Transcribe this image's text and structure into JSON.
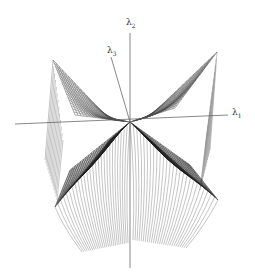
{
  "figure": {
    "type": "3d-wireframe-surface",
    "colors": {
      "background": "#ffffff",
      "mesh": "#3a3a3a",
      "mesh_dense": "#111111",
      "axis": "#555555",
      "curtain": "#7a7a7a"
    },
    "axes": {
      "vertical": {
        "symbol": "λ",
        "subscript": "2"
      },
      "diagonal": {
        "symbol": "λ",
        "subscript": "3"
      },
      "horizontal": {
        "symbol": "λ",
        "subscript": "1"
      }
    }
  }
}
